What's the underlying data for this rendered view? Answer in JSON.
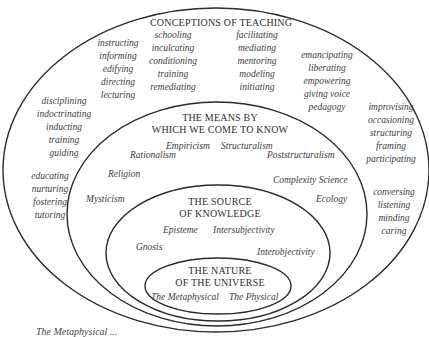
{
  "diagram": {
    "type": "nested-ellipses",
    "layers": [
      {
        "id": "conceptions",
        "title": "CONCEPTIONS OF TEACHING",
        "groups": [
          [
            "instructing",
            "informing",
            "edifying",
            "directing",
            "lecturing"
          ],
          [
            "schooling",
            "inculcating",
            "conditioning",
            "training",
            "remediating"
          ],
          [
            "facilitating",
            "mediating",
            "mentoring",
            "modeling",
            "initiating"
          ],
          [
            "emancipating",
            "liberating",
            "empowering",
            "giving voice",
            "pedagogy"
          ],
          [
            "disciplining",
            "indoctrinating",
            "inducting",
            "training",
            "guiding"
          ],
          [
            "improvising",
            "occasioning",
            "structuring",
            "framing",
            "participating"
          ],
          [
            "educating",
            "nurturing",
            "fostering",
            "tutoring"
          ],
          [
            "conversing",
            "listening",
            "minding",
            "caring"
          ]
        ]
      },
      {
        "id": "means",
        "title_line1": "THE MEANS BY",
        "title_line2": "WHICH WE COME TO KNOW",
        "terms": [
          "Empiricism",
          "Structuralism",
          "Rationalism",
          "Poststructuralism",
          "Religion",
          "Complexity Science",
          "Mysticism",
          "Ecology"
        ]
      },
      {
        "id": "source",
        "title_line1": "THE SOURCE",
        "title_line2": "OF KNOWLEDGE",
        "terms": [
          "Episteme",
          "Intersubjectivity",
          "Gnosis",
          "Interobjectivity"
        ]
      },
      {
        "id": "nature",
        "title_line1": "THE NATURE",
        "title_line2": "OF THE UNIVERSE",
        "terms": [
          "The Metaphysical",
          "The Physical"
        ]
      }
    ],
    "caption": "The Metaphysical ..."
  }
}
